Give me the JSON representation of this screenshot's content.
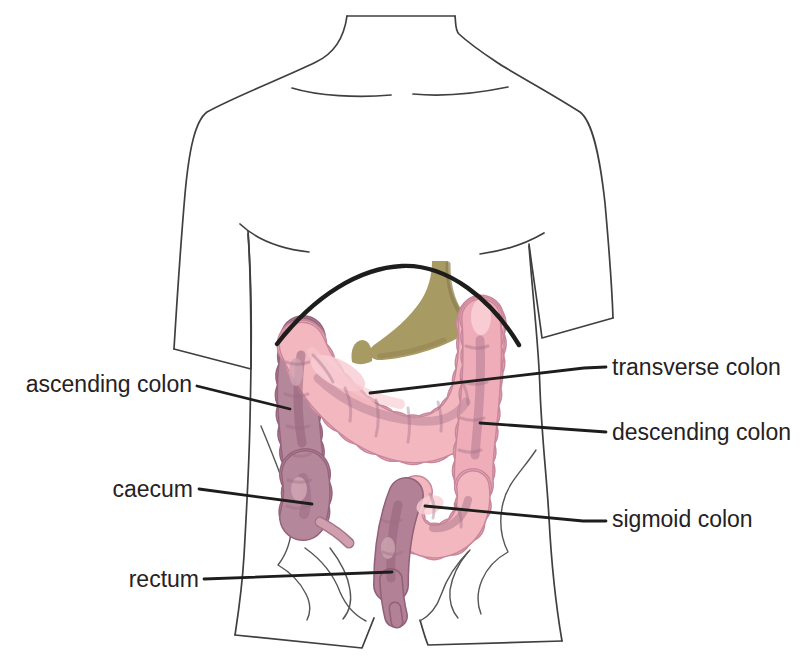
{
  "labels": [
    {
      "id": "ascending-colon",
      "text": "ascending colon"
    },
    {
      "id": "caecum",
      "text": "caecum"
    },
    {
      "id": "rectum",
      "text": "rectum"
    },
    {
      "id": "transverse-colon",
      "text": "transverse colon"
    },
    {
      "id": "descending-colon",
      "text": "descending colon"
    },
    {
      "id": "sigmoid-colon",
      "text": "sigmoid colon"
    }
  ],
  "colors": {
    "background": "#ffffff",
    "outline_gray": "#3f3f3f",
    "ink_black": "#1d1d1b",
    "colon_pink": "#f3b7c0",
    "colon_pink_dark": "#efadb9",
    "colon_outline": "#c9879b",
    "colon_mauve": "#b5879b",
    "mauve_dark": "#8f5d76",
    "highlight_pink": "#f8cfd5",
    "stomach_olive": "#a89a63"
  }
}
